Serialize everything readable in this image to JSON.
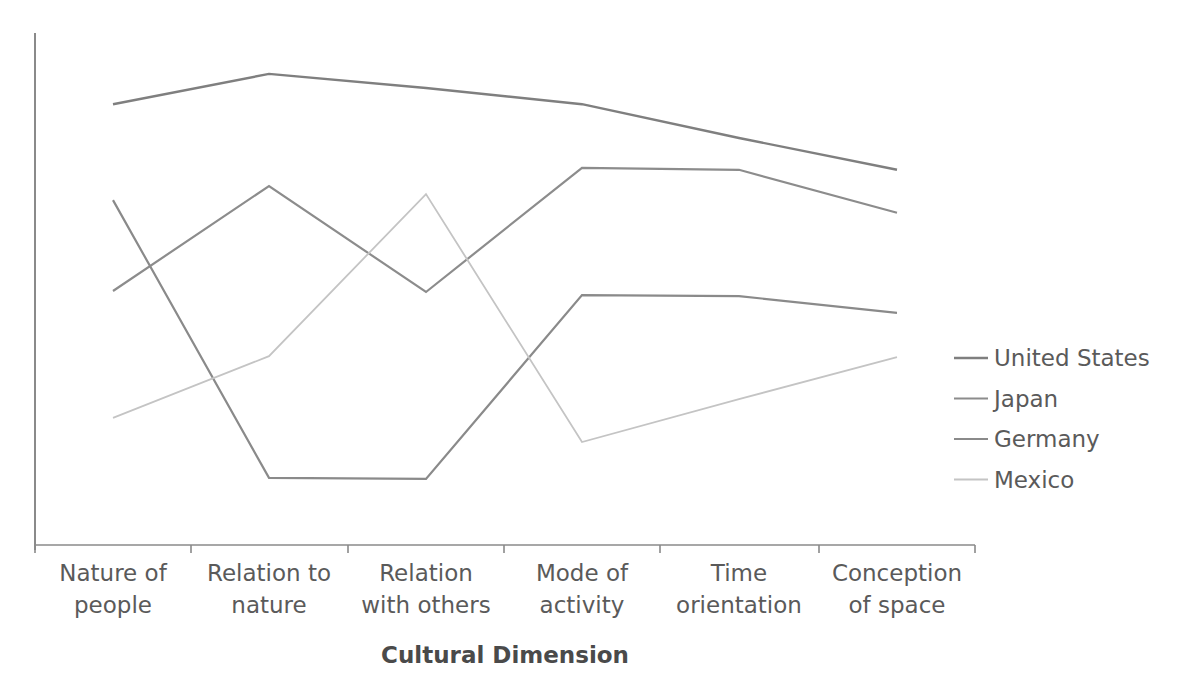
{
  "chart_data": {
    "type": "line",
    "title": "",
    "xlabel": "Cultural Dimension",
    "ylabel": "",
    "ylim": [
      0,
      100
    ],
    "y_ticks_shown": false,
    "grid": false,
    "legend_position": "right",
    "categories": [
      [
        "Nature of",
        "people"
      ],
      [
        "Relation to",
        "nature"
      ],
      [
        "Relation",
        "with others"
      ],
      [
        "Mode of",
        "activity"
      ],
      [
        "Time",
        "orientation"
      ],
      [
        "Conception",
        "of space"
      ]
    ],
    "category_names": [
      "Nature of people",
      "Relation to nature",
      "Relation with others",
      "Mode of activity",
      "Time orientation",
      "Conception of space"
    ],
    "series": [
      {
        "name": "United States",
        "color": "#7f7f7f",
        "width": 2.4,
        "values": [
          86.3,
          92.3,
          89.5,
          86.3,
          79.6,
          73.3
        ]
      },
      {
        "name": "Japan",
        "color": "#8c8c8c",
        "width": 2.2,
        "values": [
          49.3,
          70.1,
          49.1,
          73.7,
          73.3,
          64.8
        ]
      },
      {
        "name": "Germany",
        "color": "#8a8a8a",
        "width": 2.2,
        "values": [
          67.3,
          12.3,
          12.1,
          48.5,
          48.3,
          45.0
        ]
      },
      {
        "name": "Mexico",
        "color": "#c4c4c4",
        "width": 1.8,
        "values": [
          24.2,
          36.4,
          68.5,
          19.4,
          27.9,
          36.2
        ]
      }
    ]
  }
}
